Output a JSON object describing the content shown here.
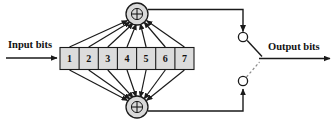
{
  "diagram": {
    "type": "convolutional-encoder",
    "title": "",
    "input_label": "Input bits",
    "output_label": "Output bits",
    "adder_symbol": "+",
    "shift_register": {
      "name": "shift-register",
      "stage_count": 7,
      "stages": [
        "1",
        "2",
        "3",
        "4",
        "5",
        "6",
        "7"
      ]
    },
    "adders": [
      {
        "name": "upper-modulo-2-adder",
        "symbol": "+",
        "position": "top"
      },
      {
        "name": "lower-modulo-2-adder",
        "symbol": "+",
        "position": "bottom"
      }
    ],
    "switch": {
      "name": "output-commutator",
      "upper_contact": "upper-switch-contact",
      "lower_contact": "lower-switch-contact",
      "connection_style": "dashed"
    },
    "colors": {
      "line": "#1a1a1a",
      "register_fill": "#dcdcdc",
      "adder_fill": "#d9d9d9",
      "dashed": "#8a8a8a",
      "text": "#111111",
      "background": "#ffffff"
    },
    "upper_taps": [
      "1",
      "2",
      "3",
      "4",
      "5",
      "6",
      "7"
    ],
    "lower_taps": [
      "1",
      "2",
      "3",
      "4",
      "5",
      "6",
      "7"
    ]
  }
}
